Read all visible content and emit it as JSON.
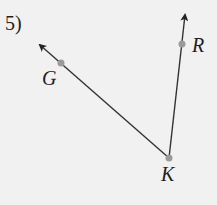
{
  "problem": {
    "number_label": "5)",
    "figure": {
      "type": "angle",
      "vertex": "K",
      "rays": [
        {
          "from": "K",
          "through": "G",
          "direction": "upper-left"
        },
        {
          "from": "K",
          "through": "R",
          "direction": "up"
        }
      ],
      "points": [
        {
          "name": "G",
          "label": "G",
          "x": 61,
          "y": 63
        },
        {
          "name": "R",
          "label": "R",
          "x": 182,
          "y": 44
        },
        {
          "name": "K",
          "label": "K",
          "x": 169,
          "y": 158
        }
      ],
      "arrow_tips": [
        {
          "ray": "KG",
          "x": 38,
          "y": 43
        },
        {
          "ray": "KR",
          "x": 185,
          "y": 13
        }
      ]
    },
    "colors": {
      "background": "#f1f1f1",
      "line": "#333333",
      "point": "#9a9a9a",
      "text": "#1e1e1e"
    }
  }
}
